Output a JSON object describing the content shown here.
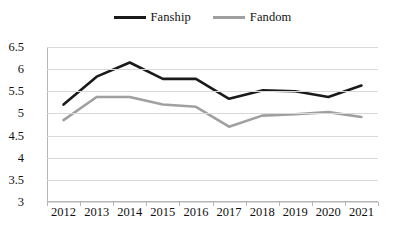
{
  "chart_data": {
    "type": "line",
    "title": "",
    "xlabel": "",
    "ylabel": "",
    "categories": [
      "2012",
      "2013",
      "2014",
      "2015",
      "2016",
      "2017",
      "2018",
      "2019",
      "2020",
      "2021"
    ],
    "series": [
      {
        "name": "Fanship",
        "color": "#1a1a1a",
        "values": [
          5.2,
          5.83,
          6.15,
          5.78,
          5.78,
          5.33,
          5.52,
          5.5,
          5.37,
          5.63
        ]
      },
      {
        "name": "Fandom",
        "color": "#a0a0a0",
        "values": [
          4.85,
          5.37,
          5.37,
          5.2,
          5.15,
          4.7,
          4.95,
          4.98,
          5.03,
          4.92
        ]
      }
    ],
    "ylim": [
      3,
      6.5
    ],
    "yticks": [
      "3",
      "3.5",
      "4",
      "4.5",
      "5",
      "5.5",
      "6",
      "6.5"
    ],
    "ytick_values": [
      3,
      3.5,
      4,
      4.5,
      5,
      5.5,
      6,
      6.5
    ],
    "grid": true,
    "legend_position": "top-center",
    "gridline_color": "#d9d9d9",
    "axis_color": "#b5b5b5",
    "background": "#ffffff"
  },
  "legend": {
    "entries": [
      {
        "label": "Fanship",
        "color": "#1a1a1a",
        "thickness": 3
      },
      {
        "label": "Fandom",
        "color": "#a0a0a0",
        "thickness": 3
      }
    ]
  }
}
